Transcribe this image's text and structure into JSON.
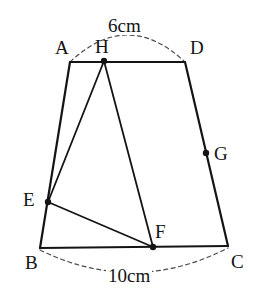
{
  "figure": {
    "type": "geometry-diagram",
    "shape": "trapezoid",
    "canvas": {
      "width": 263,
      "height": 302
    },
    "stroke_color": "#141414",
    "dash_color": "#4a4a4a",
    "background_color": "#ffffff",
    "solid_stroke_width": 2.2,
    "dashed_stroke_width": 1.2,
    "point_radius": 3.2
  },
  "vertices": {
    "A": {
      "label": "A",
      "x": 70,
      "y": 62,
      "label_x": 55,
      "label_y": 38,
      "marked": false
    },
    "B": {
      "label": "B",
      "x": 40,
      "y": 248,
      "label_x": 25,
      "label_y": 253,
      "marked": false
    },
    "C": {
      "label": "C",
      "x": 228,
      "y": 246,
      "label_x": 231,
      "label_y": 252,
      "marked": false
    },
    "D": {
      "label": "D",
      "x": 185,
      "y": 62,
      "label_x": 190,
      "label_y": 38,
      "marked": false
    },
    "E": {
      "label": "E",
      "x": 48,
      "y": 202,
      "label_x": 23,
      "label_y": 190,
      "marked": true
    },
    "F": {
      "label": "F",
      "x": 153,
      "y": 247,
      "label_x": 155,
      "label_y": 222,
      "marked": true
    },
    "G": {
      "label": "G",
      "x": 206,
      "y": 153,
      "label_x": 214,
      "label_y": 144,
      "marked": true
    },
    "H": {
      "label": "H",
      "x": 104,
      "y": 61,
      "label_x": 95,
      "label_y": 37,
      "marked": true
    }
  },
  "segments": [
    {
      "name": "AD",
      "from": "A",
      "to": "D",
      "style": "solid"
    },
    {
      "name": "AB",
      "from": "A",
      "to": "B",
      "style": "solid"
    },
    {
      "name": "DC",
      "from": "D",
      "to": "C",
      "style": "solid"
    },
    {
      "name": "BC",
      "from": "B",
      "to": "C",
      "style": "solid"
    },
    {
      "name": "HE",
      "from": "H",
      "to": "E",
      "style": "solid"
    },
    {
      "name": "HF",
      "from": "H",
      "to": "F",
      "style": "solid"
    },
    {
      "name": "EF",
      "from": "E",
      "to": "F",
      "style": "solid"
    }
  ],
  "dimension_arcs": [
    {
      "name": "top-arc-AD",
      "path": "M 70 62 Q 127.5 8 185 62",
      "measures": "AD",
      "label": "6cm",
      "label_x": 106,
      "label_y": 16
    },
    {
      "name": "bottom-arc-BC",
      "path": "M 40 250 Q 134 296 228 248",
      "measures": "BC",
      "label": "10cm",
      "label_x": 106,
      "label_y": 266
    }
  ],
  "dimensions": {
    "top_side_length": "6cm",
    "bottom_side_length": "10cm"
  }
}
